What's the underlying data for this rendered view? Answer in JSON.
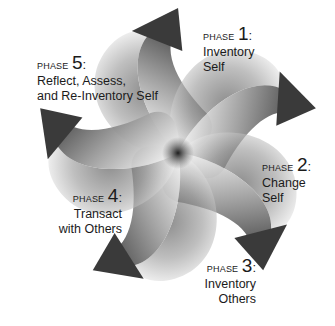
{
  "diagram": {
    "type": "cycle",
    "center_color": "#2a2a2a",
    "arrow_color": "#3a3a3a",
    "phases": [
      {
        "prefix": "PHASE",
        "number": "1",
        "lines": [
          "Inventory",
          "Self"
        ]
      },
      {
        "prefix": "PHASE",
        "number": "2",
        "lines": [
          "Change",
          "Self"
        ]
      },
      {
        "prefix": "PHASE",
        "number": "3",
        "lines": [
          "Inventory",
          "Others"
        ]
      },
      {
        "prefix": "PHASE",
        "number": "4",
        "lines": [
          "Transact",
          "with Others"
        ]
      },
      {
        "prefix": "PHASE",
        "number": "5",
        "lines": [
          "Reflect, Assess,",
          "and Re-Inventory Self"
        ]
      }
    ]
  }
}
